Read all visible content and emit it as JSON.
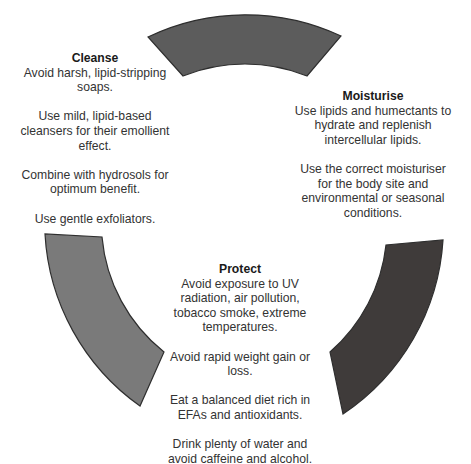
{
  "diagram": {
    "type": "cycle",
    "colors": {
      "background": "#ffffff",
      "arc_top": "#5c5c5c",
      "arc_left": "#7a7a7a",
      "arc_right": "#3f3b3a",
      "arc_stroke": "#2e2e2e",
      "text": "#333333"
    },
    "sections": {
      "cleanse": {
        "title": "Cleanse",
        "paragraphs": [
          "Avoid harsh, lipid-stripping soaps.",
          "Use mild, lipid-based cleansers for their emollient effect.",
          "Combine with hydrosols for optimum benefit.",
          "Use gentle exfoliators."
        ]
      },
      "moisturise": {
        "title": "Moisturise",
        "paragraphs": [
          "Use lipids and humectants to hydrate and replenish intercellular lipids.",
          "Use the correct moisturiser for the body site and environmental or seasonal conditions."
        ]
      },
      "protect": {
        "title": "Protect",
        "paragraphs": [
          "Avoid exposure to UV radiation, air pollution, tobacco smoke, extreme temperatures.",
          "Avoid rapid weight gain or loss.",
          "Eat a balanced diet rich in EFAs and antioxidants.",
          "Drink plenty of water and avoid caffeine and alcohol."
        ]
      }
    }
  }
}
